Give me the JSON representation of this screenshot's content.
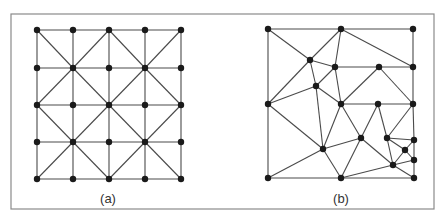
{
  "figure": {
    "frame": {
      "x": 11,
      "y": 14,
      "width": 423,
      "height": 195
    },
    "colors": {
      "edge": "#4a4a4a",
      "node": "#1a1a1a",
      "frame": "#8a8a8a",
      "label": "#333333"
    },
    "panels": [
      {
        "id": "a",
        "label": "(a)",
        "label_pos": [
          108,
          203
        ],
        "description": "Structured 5x5 triangular mesh",
        "nodes": [
          [
            37,
            30
          ],
          [
            73,
            30
          ],
          [
            109,
            30
          ],
          [
            145,
            30
          ],
          [
            181,
            30
          ],
          [
            37,
            68
          ],
          [
            73,
            68
          ],
          [
            109,
            68
          ],
          [
            145,
            68
          ],
          [
            181,
            68
          ],
          [
            37,
            105
          ],
          [
            73,
            105
          ],
          [
            109,
            105
          ],
          [
            145,
            105
          ],
          [
            181,
            105
          ],
          [
            37,
            142
          ],
          [
            73,
            142
          ],
          [
            109,
            142
          ],
          [
            145,
            142
          ],
          [
            181,
            142
          ],
          [
            37,
            179
          ],
          [
            73,
            179
          ],
          [
            109,
            179
          ],
          [
            145,
            179
          ],
          [
            181,
            179
          ]
        ],
        "edges": [
          [
            0,
            1
          ],
          [
            1,
            2
          ],
          [
            2,
            3
          ],
          [
            3,
            4
          ],
          [
            5,
            6
          ],
          [
            6,
            7
          ],
          [
            7,
            8
          ],
          [
            8,
            9
          ],
          [
            10,
            11
          ],
          [
            11,
            12
          ],
          [
            12,
            13
          ],
          [
            13,
            14
          ],
          [
            15,
            16
          ],
          [
            16,
            17
          ],
          [
            17,
            18
          ],
          [
            18,
            19
          ],
          [
            20,
            21
          ],
          [
            21,
            22
          ],
          [
            22,
            23
          ],
          [
            23,
            24
          ],
          [
            0,
            5
          ],
          [
            5,
            10
          ],
          [
            10,
            15
          ],
          [
            15,
            20
          ],
          [
            1,
            6
          ],
          [
            6,
            11
          ],
          [
            11,
            16
          ],
          [
            16,
            21
          ],
          [
            2,
            7
          ],
          [
            7,
            12
          ],
          [
            12,
            17
          ],
          [
            17,
            22
          ],
          [
            3,
            8
          ],
          [
            8,
            13
          ],
          [
            13,
            18
          ],
          [
            18,
            23
          ],
          [
            4,
            9
          ],
          [
            9,
            14
          ],
          [
            14,
            19
          ],
          [
            19,
            24
          ],
          [
            0,
            6
          ],
          [
            6,
            12
          ],
          [
            12,
            18
          ],
          [
            18,
            24
          ],
          [
            4,
            8
          ],
          [
            8,
            12
          ],
          [
            12,
            16
          ],
          [
            16,
            20
          ],
          [
            2,
            6
          ],
          [
            6,
            10
          ],
          [
            10,
            16
          ],
          [
            16,
            22
          ],
          [
            22,
            18
          ],
          [
            18,
            14
          ],
          [
            14,
            8
          ],
          [
            8,
            2
          ]
        ]
      },
      {
        "id": "b",
        "label": "(b)",
        "label_pos": [
          341,
          203
        ],
        "description": "Unstructured triangular mesh",
        "nodes": [
          [
            268,
            29
          ],
          [
            341,
            29
          ],
          [
            413,
            29
          ],
          [
            310,
            60
          ],
          [
            335,
            67
          ],
          [
            379,
            67
          ],
          [
            413,
            67
          ],
          [
            316,
            86
          ],
          [
            268,
            104
          ],
          [
            341,
            104
          ],
          [
            378,
            104
          ],
          [
            413,
            104
          ],
          [
            361,
            138
          ],
          [
            387,
            138
          ],
          [
            414,
            140
          ],
          [
            323,
            149
          ],
          [
            405,
            150
          ],
          [
            414,
            160
          ],
          [
            393,
            165
          ],
          [
            268,
            178
          ],
          [
            341,
            178
          ],
          [
            414,
            178
          ]
        ],
        "edges": [
          [
            0,
            1
          ],
          [
            1,
            2
          ],
          [
            0,
            8
          ],
          [
            2,
            6
          ],
          [
            6,
            11
          ],
          [
            11,
            14
          ],
          [
            14,
            17
          ],
          [
            17,
            21
          ],
          [
            8,
            19
          ],
          [
            19,
            20
          ],
          [
            20,
            21
          ],
          [
            0,
            3
          ],
          [
            1,
            3
          ],
          [
            1,
            4
          ],
          [
            3,
            4
          ],
          [
            3,
            7
          ],
          [
            4,
            7
          ],
          [
            4,
            9
          ],
          [
            4,
            5
          ],
          [
            5,
            6
          ],
          [
            1,
            6
          ],
          [
            7,
            8
          ],
          [
            3,
            8
          ],
          [
            7,
            9
          ],
          [
            7,
            15
          ],
          [
            8,
            15
          ],
          [
            9,
            10
          ],
          [
            10,
            11
          ],
          [
            5,
            9
          ],
          [
            5,
            11
          ],
          [
            9,
            15
          ],
          [
            9,
            12
          ],
          [
            15,
            12
          ],
          [
            15,
            20
          ],
          [
            15,
            19
          ],
          [
            12,
            20
          ],
          [
            10,
            12
          ],
          [
            10,
            13
          ],
          [
            11,
            13
          ],
          [
            12,
            18
          ],
          [
            20,
            18
          ],
          [
            13,
            14
          ],
          [
            13,
            16
          ],
          [
            13,
            18
          ],
          [
            16,
            14
          ],
          [
            16,
            17
          ],
          [
            16,
            18
          ],
          [
            18,
            17
          ],
          [
            18,
            21
          ]
        ]
      }
    ]
  }
}
